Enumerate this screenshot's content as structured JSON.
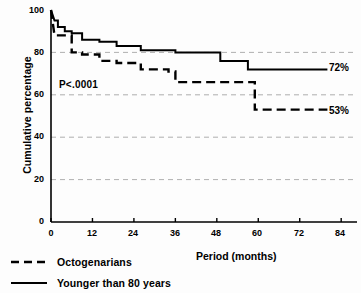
{
  "chart_data": {
    "type": "line",
    "title": "",
    "xlabel": "Period (months)",
    "ylabel": "Cumulative percentage",
    "xlim": [
      0,
      88
    ],
    "ylim": [
      0,
      100
    ],
    "xticks": [
      0,
      12,
      24,
      36,
      48,
      60,
      72,
      84
    ],
    "yticks": [
      0,
      20,
      40,
      60,
      80,
      100
    ],
    "grid": "horizontal dashed gridlines at 20, 40, 60, 80",
    "legend_position": "below-axis-left",
    "annotations": [
      {
        "name": "p-value",
        "text": "P<.0001",
        "x": 7,
        "y": 67
      }
    ],
    "series": [
      {
        "name": "Younger than 80 years",
        "style": "solid",
        "end_label": "72%",
        "end_value": 72,
        "steps": [
          [
            0,
            100
          ],
          [
            1,
            95
          ],
          [
            2,
            95
          ],
          [
            2,
            92
          ],
          [
            4,
            92
          ],
          [
            4,
            90
          ],
          [
            6,
            90
          ],
          [
            6,
            89
          ],
          [
            9,
            89
          ],
          [
            9,
            86
          ],
          [
            14,
            86
          ],
          [
            14,
            85
          ],
          [
            19,
            85
          ],
          [
            19,
            83
          ],
          [
            26,
            83
          ],
          [
            26,
            81
          ],
          [
            36,
            81
          ],
          [
            36,
            80
          ],
          [
            49,
            80
          ],
          [
            49,
            76
          ],
          [
            57,
            76
          ],
          [
            57,
            72
          ],
          [
            80,
            72
          ]
        ]
      },
      {
        "name": "Octogenarians",
        "style": "dashed",
        "end_label": "53%",
        "end_value": 53,
        "steps": [
          [
            0,
            100
          ],
          [
            1,
            88
          ],
          [
            6,
            88
          ],
          [
            6,
            80
          ],
          [
            9,
            80
          ],
          [
            9,
            79
          ],
          [
            14,
            79
          ],
          [
            14,
            76
          ],
          [
            19,
            76
          ],
          [
            19,
            75
          ],
          [
            26,
            75
          ],
          [
            26,
            72
          ],
          [
            34,
            72
          ],
          [
            34,
            71
          ],
          [
            36,
            71
          ],
          [
            36,
            66
          ],
          [
            59,
            66
          ],
          [
            59,
            53
          ],
          [
            80,
            53
          ]
        ]
      }
    ]
  },
  "axes": {
    "ylabel": "Cumulative percentage",
    "xlabel": "Period (months)",
    "ytick_labels": [
      "100",
      "80",
      "60",
      "40",
      "20",
      "0"
    ],
    "xtick_labels": [
      "0",
      "12",
      "24",
      "36",
      "48",
      "60",
      "72",
      "84"
    ]
  },
  "annotations": {
    "pvalue": "P<.0001",
    "solid_end": "72%",
    "dashed_end": "53%"
  },
  "legend": {
    "items": [
      {
        "label": "Octogenarians",
        "style": "dashed"
      },
      {
        "label": "Younger than 80 years",
        "style": "solid"
      }
    ]
  }
}
